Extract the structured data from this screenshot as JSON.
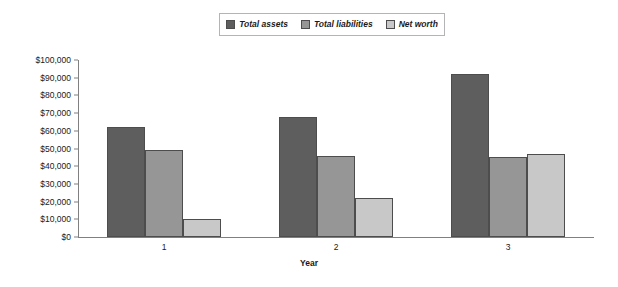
{
  "chart_data": {
    "type": "bar",
    "title": "",
    "xlabel": "Year",
    "ylabel": "",
    "categories": [
      "1",
      "2",
      "3"
    ],
    "series": [
      {
        "name": "Total assets",
        "color": "#5e5e5e",
        "values": [
          62000,
          68000,
          92000
        ]
      },
      {
        "name": "Total liabilities",
        "color": "#969696",
        "values": [
          49000,
          46000,
          45000
        ]
      },
      {
        "name": "Net worth",
        "color": "#c8c8c8",
        "values": [
          10000,
          22000,
          47000
        ]
      }
    ],
    "ylim": [
      0,
      100000
    ],
    "ytick_step": 10000,
    "ytick_labels": [
      "$100,000",
      "$90,000",
      "$80,000",
      "$70,000",
      "$60,000",
      "$50,000",
      "$40,000",
      "$30,000",
      "$20,000",
      "$10,000",
      "$0"
    ],
    "ytick_values": [
      100000,
      90000,
      80000,
      70000,
      60000,
      50000,
      40000,
      30000,
      20000,
      10000,
      0
    ],
    "grid": false,
    "legend_position": "top-center",
    "currency_prefix": "$"
  },
  "legend": {
    "items": [
      {
        "label": "Total assets",
        "color": "#5e5e5e"
      },
      {
        "label": "Total liabilities",
        "color": "#969696"
      },
      {
        "label": "Net worth",
        "color": "#c8c8c8"
      }
    ]
  },
  "axes": {
    "x_title": "Year",
    "axis_color": "#808080"
  }
}
